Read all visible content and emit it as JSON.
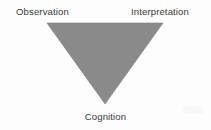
{
  "diagram": {
    "type": "inverted-triangle",
    "title": "",
    "background_color": "#fdfdfd",
    "shape": {
      "name": "inverted-triangle",
      "fill_color": "#8a8a8a",
      "edge_color": "#7d7d7d",
      "top_left_vertex": [
        47,
        23
      ],
      "top_right_vertex": [
        163,
        23
      ],
      "bottom_apex_vertex": [
        105,
        104
      ]
    },
    "nodes": [
      {
        "id": "observation",
        "label": "Observation",
        "position": "top-left"
      },
      {
        "id": "interpretation",
        "label": "Interpretation",
        "position": "top-right"
      },
      {
        "id": "cognition",
        "label": "Cognition",
        "position": "bottom-center"
      }
    ],
    "text_color": "#3b3b3b"
  }
}
